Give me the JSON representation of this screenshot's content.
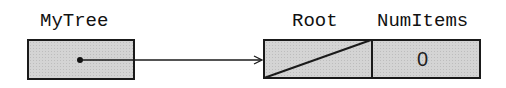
{
  "diagram": {
    "variable": {
      "name": "MyTree",
      "content": "pointer"
    },
    "node": {
      "fields": [
        {
          "name": "Root",
          "value": "null",
          "display": ""
        },
        {
          "name": "NumItems",
          "value": "0",
          "display": "0"
        }
      ]
    },
    "colors": {
      "box_fill": "#d4d4d4",
      "stroke": "#1a1a1a",
      "text": "#111111"
    }
  }
}
